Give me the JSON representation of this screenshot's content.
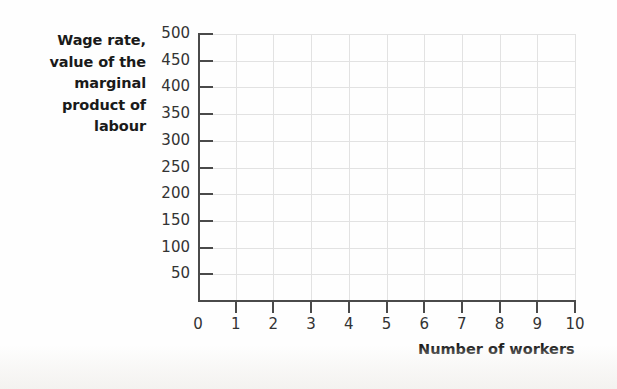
{
  "chart_data": {
    "type": "line",
    "title": "",
    "subtitle": "",
    "xlabel": "Number of workers",
    "ylabel": "Wage rate, value of the marginal product of labour",
    "ylabel_lines": [
      "Wage rate,",
      "value of the",
      "marginal",
      "product of",
      "labour"
    ],
    "xlim": [
      0,
      10
    ],
    "ylim": [
      0,
      500
    ],
    "xticks": [
      0,
      1,
      2,
      3,
      4,
      5,
      6,
      7,
      8,
      9,
      10
    ],
    "xticklabels": [
      "0",
      "1",
      "2",
      "3",
      "4",
      "5",
      "6",
      "7",
      "8",
      "9",
      "10"
    ],
    "yticks": [
      50,
      100,
      150,
      200,
      250,
      300,
      350,
      400,
      450,
      500
    ],
    "yticklabels": [
      "50",
      "100",
      "150",
      "200",
      "250",
      "300",
      "350",
      "400",
      "450",
      "500"
    ],
    "ytick_step": 50,
    "xtick_step": 1,
    "grid": true,
    "grid_color": "#e2e2e2",
    "axis_color": "#4a4a4a",
    "background_color": "#ffffff",
    "legend": [],
    "annotations": [],
    "series": [],
    "values": [],
    "categories": [],
    "note": "Empty plotting grid: no data series are drawn."
  },
  "figure": {
    "axis_color": "#4a4a4a",
    "grid_color": "#e2e2e2",
    "label_color": "#1a1a1a",
    "tick_label_color": "#333333"
  }
}
